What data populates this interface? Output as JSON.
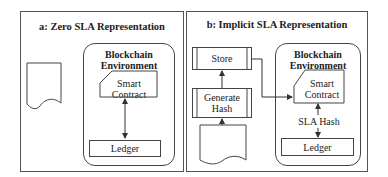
{
  "figure": {
    "panels": [
      {
        "id": "a",
        "title": "a: Zero SLA Representation",
        "document": "SLA",
        "environment": {
          "title_line1": "Blockchain",
          "title_line2": "Environment",
          "smart_contract_line1": "Smart",
          "smart_contract_line2": "Contract",
          "ledger": "Ledger"
        }
      },
      {
        "id": "b",
        "title": "b: Implicit SLA Representation",
        "document": "SLA",
        "processes": {
          "store": "Store",
          "generate_hash_line1": "Generate",
          "generate_hash_line2": "Hash"
        },
        "environment": {
          "title_line1": "Blockchain",
          "title_line2": "Environment",
          "smart_contract_line1": "Smart",
          "smart_contract_line2": "Contract",
          "hash_label": "SLA Hash",
          "ledger": "Ledger"
        }
      }
    ],
    "colors": {
      "stroke": "#444444",
      "text": "#222222",
      "background": "#ffffff"
    }
  }
}
